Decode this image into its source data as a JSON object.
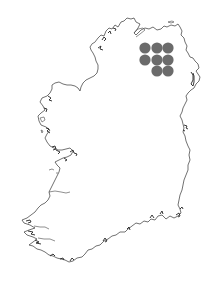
{
  "map": {
    "region": "Ireland",
    "style": "coastline outline",
    "background_color": "#ffffff",
    "coastline_color": "#333333",
    "marker_color": "#6b6b6b",
    "marker_radius": 5.6,
    "markers": [
      {
        "id": "m1",
        "x": 145,
        "y": 48
      },
      {
        "id": "m2",
        "x": 157,
        "y": 48
      },
      {
        "id": "m3",
        "x": 168,
        "y": 48
      },
      {
        "id": "m4",
        "x": 145,
        "y": 60
      },
      {
        "id": "m5",
        "x": 157,
        "y": 60
      },
      {
        "id": "m6",
        "x": 168,
        "y": 60
      },
      {
        "id": "m7",
        "x": 157,
        "y": 71
      },
      {
        "id": "m8",
        "x": 168,
        "y": 71
      }
    ]
  }
}
